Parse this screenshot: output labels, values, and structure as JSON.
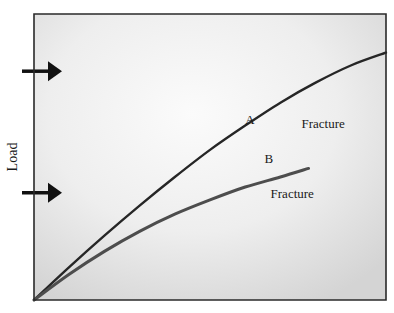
{
  "chart_data": {
    "type": "line",
    "title": "",
    "xlabel": "",
    "ylabel": "Load",
    "xlim": [
      0,
      1
    ],
    "ylim": [
      0,
      1
    ],
    "grid": false,
    "legend": "none",
    "series": [
      {
        "name": "A",
        "label": "A",
        "end_annotation": "Fracture",
        "color": "#262626",
        "x": [
          0,
          0.1,
          0.2,
          0.3,
          0.4,
          0.5,
          0.6,
          0.7,
          0.8,
          0.9,
          1.0
        ],
        "y": [
          0,
          0.115,
          0.225,
          0.33,
          0.43,
          0.525,
          0.61,
          0.69,
          0.76,
          0.82,
          0.865
        ]
      },
      {
        "name": "B",
        "label": "B",
        "end_annotation": "Fracture",
        "color": "#4d4d4d",
        "x": [
          0,
          0.1,
          0.2,
          0.3,
          0.4,
          0.5,
          0.6,
          0.7,
          0.78
        ],
        "y": [
          0,
          0.09,
          0.17,
          0.24,
          0.3,
          0.35,
          0.395,
          0.43,
          0.46
        ]
      }
    ],
    "markers": [
      {
        "name": "arrow-upper",
        "y": 0.8,
        "direction": "right"
      },
      {
        "name": "arrow-lower",
        "y": 0.375,
        "direction": "right"
      }
    ]
  }
}
